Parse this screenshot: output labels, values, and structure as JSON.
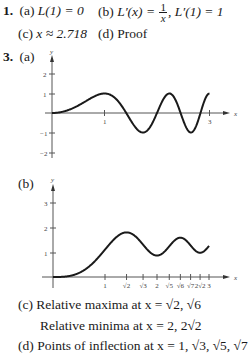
{
  "problem1": {
    "number": "1.",
    "a_label": "(a)",
    "a_text": "L(1) = 0",
    "b_label": "(b)",
    "b_lhs": "L′(x) =",
    "b_num": "1",
    "b_den": "x",
    "b_rest": ", L′(1) = 1",
    "c_label": "(c)",
    "c_text": "x ≈ 2.718",
    "d_label": "(d)",
    "d_text": "Proof"
  },
  "problem3": {
    "number": "3.",
    "a_label": "(a)",
    "b_label": "(b)",
    "c_label": "(c)",
    "c_line1": "Relative maxima at x = √2, √6",
    "c_line2": "Relative minima at x = 2, 2√2",
    "d_label": "(d)",
    "d_text": "Points of inflection at x = 1, √3, √5, √7"
  },
  "chart_data": [
    {
      "type": "line",
      "title": "3(a)",
      "function": "y = sin(πx²/2)",
      "xlabel": "x",
      "ylabel": "y",
      "xlim": [
        0,
        3
      ],
      "ylim": [
        -2,
        2
      ],
      "x_ticks": [
        "1",
        "3"
      ],
      "y_ticks": [
        "2",
        "1",
        "-1",
        "-2"
      ],
      "x": [
        0,
        0.5,
        1,
        1.414,
        1.732,
        2,
        2.236,
        2.449,
        2.646,
        2.828,
        3
      ],
      "values": [
        0,
        0.38,
        1,
        0,
        -1,
        0,
        1,
        0,
        -1,
        0,
        1
      ],
      "grid": false
    },
    {
      "type": "line",
      "title": "3(b)",
      "xlabel": "x",
      "ylabel": "y",
      "xlim": [
        0,
        3
      ],
      "ylim": [
        0,
        3
      ],
      "x_ticks": [
        "1",
        "√2",
        "√3",
        "2",
        "√5",
        "√6",
        "√7",
        "2√2",
        "3"
      ],
      "y_ticks": [
        "3",
        "2",
        "1"
      ],
      "x": [
        0,
        1,
        1.414,
        1.732,
        2,
        2.236,
        2.449,
        2.646,
        2.828,
        3
      ],
      "values": [
        0,
        1.1,
        1.78,
        1.5,
        0.86,
        1.2,
        1.37,
        1.1,
        0.85,
        1.25
      ],
      "grid": false
    }
  ]
}
